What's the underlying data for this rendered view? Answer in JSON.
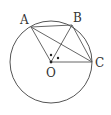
{
  "diagram": {
    "type": "circle-geometry",
    "colors": {
      "stroke": "#555555",
      "label": "#333333",
      "background": "#ffffff"
    },
    "circle": {
      "center": "O",
      "cx": 51,
      "cy": 62,
      "r": 41
    },
    "points": [
      {
        "name": "A",
        "label": "A",
        "x": 31,
        "y": 27,
        "lx": 20,
        "ly": 24
      },
      {
        "name": "B",
        "label": "B",
        "x": 72,
        "y": 25,
        "lx": 73,
        "ly": 22
      },
      {
        "name": "C",
        "label": "C",
        "x": 92,
        "y": 62,
        "lx": 95,
        "ly": 67
      },
      {
        "name": "O",
        "label": "O",
        "x": 51,
        "y": 62,
        "lx": 46,
        "ly": 77
      }
    ],
    "segments": [
      [
        "A",
        "B"
      ],
      [
        "A",
        "C"
      ],
      [
        "A",
        "O"
      ],
      [
        "B",
        "O"
      ],
      [
        "B",
        "C"
      ],
      [
        "O",
        "C"
      ]
    ],
    "angle_marks": [
      {
        "note": "equal-angle dot between OA and OB",
        "x": 51,
        "y": 55
      },
      {
        "note": "equal-angle dot between OB and OC",
        "x": 58,
        "y": 58
      }
    ]
  }
}
